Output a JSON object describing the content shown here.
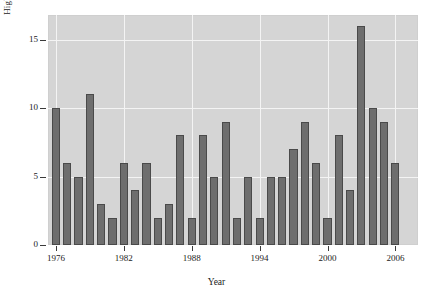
{
  "chart_data": {
    "type": "bar",
    "title": "",
    "xlabel": "Year",
    "ylabel": "High-Repression Spells",
    "ylim": [
      0,
      16.8
    ],
    "xlim": [
      1975.3,
      2008.0
    ],
    "yticks": [
      0,
      5,
      10,
      15
    ],
    "ytick_labels": [
      "0",
      "5",
      "10",
      "15"
    ],
    "xticks": [
      1976,
      1982,
      1988,
      1994,
      2000,
      2006
    ],
    "xtick_labels": [
      "1976",
      "1982",
      "1988",
      "1994",
      "2000",
      "2006"
    ],
    "grid": true,
    "legend": "none",
    "panel_background": "#d5d5d5",
    "grid_color": "#f4f4f4",
    "bar_fill": "#6e6e6e",
    "bar_edge": "#4a4a4a",
    "categories": [
      "1976",
      "1977",
      "1978",
      "1979",
      "1980",
      "1981",
      "1982",
      "1983",
      "1984",
      "1985",
      "1986",
      "1987",
      "1988",
      "1989",
      "1990",
      "1991",
      "1992",
      "1993",
      "1994",
      "1995",
      "1996",
      "1997",
      "1998",
      "1999",
      "2000",
      "2001",
      "2002",
      "2003",
      "2004",
      "2005",
      "2006",
      "2007"
    ],
    "values": [
      10,
      6,
      5,
      11,
      3,
      2,
      6,
      4,
      6,
      2,
      3,
      8,
      2,
      8,
      5,
      9,
      2,
      5,
      2,
      5,
      5,
      7,
      9,
      6,
      2,
      8,
      4,
      16,
      10,
      9,
      6,
      0
    ]
  }
}
